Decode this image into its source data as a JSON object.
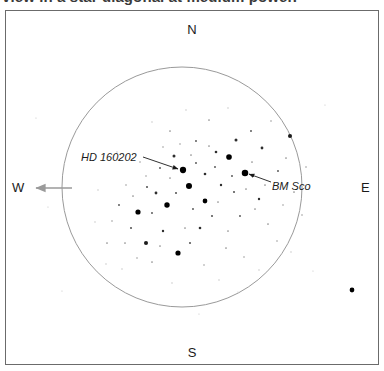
{
  "caption": {
    "text": "view in a star diagonal at medium power."
  },
  "chart_data": {
    "type": "scatter",
    "title": "",
    "subtitle": "",
    "xlabel": "",
    "ylabel": "",
    "grid": false,
    "legend": "none",
    "field_circle": {
      "cx": 182,
      "cy": 187,
      "r": 120,
      "stroke": "#9a9a9a",
      "stroke_width": 1
    },
    "orientation": {
      "north": "N",
      "south": "S",
      "east": "E",
      "west": "W"
    },
    "west_arrow": {
      "x1": 72,
      "y1": 188,
      "x2": 36,
      "y2": 188,
      "color": "#9a9a9a"
    },
    "annotations": [
      {
        "id": "hd160202",
        "label": "HD 160202",
        "label_x": 81,
        "label_y": 151,
        "leader_x1": 143,
        "leader_y1": 157,
        "leader_x2": 178,
        "leader_y2": 169,
        "target_x": 183,
        "target_y": 170
      },
      {
        "id": "bmsco",
        "label": "BM Sco",
        "label_x": 272,
        "label_y": 180,
        "leader_x1": 271,
        "leader_y1": 182,
        "leader_x2": 249,
        "leader_y2": 174,
        "target_x": 245,
        "target_y": 173
      }
    ],
    "stars": [
      {
        "x": 183,
        "y": 170,
        "mag": 2.9,
        "note": "HD 160202"
      },
      {
        "x": 245,
        "y": 173,
        "mag": 3.0,
        "note": "BM Sco"
      },
      {
        "x": 229,
        "y": 157,
        "mag": 2.6
      },
      {
        "x": 189,
        "y": 186,
        "mag": 2.8
      },
      {
        "x": 167,
        "y": 205,
        "mag": 2.5
      },
      {
        "x": 138,
        "y": 212,
        "mag": 2.4
      },
      {
        "x": 205,
        "y": 201,
        "mag": 2.2
      },
      {
        "x": 178,
        "y": 253,
        "mag": 2.4
      },
      {
        "x": 146,
        "y": 243,
        "mag": 1.9
      },
      {
        "x": 290,
        "y": 136,
        "mag": 1.9
      },
      {
        "x": 352,
        "y": 290,
        "mag": 2.2
      },
      {
        "x": 236,
        "y": 140,
        "mag": 1.4
      },
      {
        "x": 262,
        "y": 148,
        "mag": 1.3
      },
      {
        "x": 174,
        "y": 156,
        "mag": 1.4
      },
      {
        "x": 216,
        "y": 152,
        "mag": 1.2
      },
      {
        "x": 156,
        "y": 193,
        "mag": 1.3
      },
      {
        "x": 200,
        "y": 228,
        "mag": 1.2
      },
      {
        "x": 221,
        "y": 185,
        "mag": 1.1
      },
      {
        "x": 259,
        "y": 199,
        "mag": 1.1
      },
      {
        "x": 147,
        "y": 187,
        "mag": 1.0
      },
      {
        "x": 131,
        "y": 228,
        "mag": 1.0
      },
      {
        "x": 163,
        "y": 231,
        "mag": 1.1
      },
      {
        "x": 190,
        "y": 243,
        "mag": 1.0
      },
      {
        "x": 212,
        "y": 216,
        "mag": 1.0
      },
      {
        "x": 240,
        "y": 216,
        "mag": 0.9
      },
      {
        "x": 278,
        "y": 171,
        "mag": 0.9
      },
      {
        "x": 251,
        "y": 131,
        "mag": 0.9
      },
      {
        "x": 196,
        "y": 141,
        "mag": 0.9
      },
      {
        "x": 160,
        "y": 168,
        "mag": 0.9
      },
      {
        "x": 119,
        "y": 205,
        "mag": 0.9
      },
      {
        "x": 107,
        "y": 243,
        "mag": 0.8
      },
      {
        "x": 152,
        "y": 262,
        "mag": 0.8
      },
      {
        "x": 226,
        "y": 248,
        "mag": 0.8
      },
      {
        "x": 268,
        "y": 224,
        "mag": 0.8
      },
      {
        "x": 294,
        "y": 192,
        "mag": 0.8
      },
      {
        "x": 286,
        "y": 158,
        "mag": 0.8
      },
      {
        "x": 209,
        "y": 120,
        "mag": 0.8
      },
      {
        "x": 170,
        "y": 131,
        "mag": 0.8
      },
      {
        "x": 140,
        "y": 162,
        "mag": 0.7
      },
      {
        "x": 126,
        "y": 185,
        "mag": 0.7
      },
      {
        "x": 112,
        "y": 221,
        "mag": 0.7
      },
      {
        "x": 137,
        "y": 258,
        "mag": 0.7
      },
      {
        "x": 204,
        "y": 265,
        "mag": 0.7
      },
      {
        "x": 244,
        "y": 257,
        "mag": 0.7
      },
      {
        "x": 277,
        "y": 241,
        "mag": 0.7
      },
      {
        "x": 302,
        "y": 215,
        "mag": 0.7
      },
      {
        "x": 306,
        "y": 167,
        "mag": 0.7
      },
      {
        "x": 271,
        "y": 121,
        "mag": 0.7
      },
      {
        "x": 228,
        "y": 108,
        "mag": 0.6
      },
      {
        "x": 186,
        "y": 110,
        "mag": 0.6
      },
      {
        "x": 152,
        "y": 122,
        "mag": 0.6
      },
      {
        "x": 117,
        "y": 152,
        "mag": 0.6
      },
      {
        "x": 98,
        "y": 190,
        "mag": 0.6
      },
      {
        "x": 95,
        "y": 222,
        "mag": 0.6
      },
      {
        "x": 122,
        "y": 269,
        "mag": 0.6
      },
      {
        "x": 172,
        "y": 283,
        "mag": 0.6
      },
      {
        "x": 219,
        "y": 280,
        "mag": 0.6
      },
      {
        "x": 259,
        "y": 270,
        "mag": 0.6
      },
      {
        "x": 291,
        "y": 252,
        "mag": 0.6
      },
      {
        "x": 205,
        "y": 174,
        "mag": 1.2
      },
      {
        "x": 215,
        "y": 167,
        "mag": 0.9
      },
      {
        "x": 196,
        "y": 163,
        "mag": 0.9
      },
      {
        "x": 232,
        "y": 176,
        "mag": 0.9
      },
      {
        "x": 234,
        "y": 192,
        "mag": 1.0
      },
      {
        "x": 176,
        "y": 193,
        "mag": 1.0
      },
      {
        "x": 193,
        "y": 209,
        "mag": 0.9
      },
      {
        "x": 152,
        "y": 213,
        "mag": 0.9
      },
      {
        "x": 218,
        "y": 202,
        "mag": 0.8
      },
      {
        "x": 246,
        "y": 189,
        "mag": 0.8
      },
      {
        "x": 170,
        "y": 178,
        "mag": 0.8
      },
      {
        "x": 191,
        "y": 155,
        "mag": 0.8
      },
      {
        "x": 209,
        "y": 146,
        "mag": 0.8
      },
      {
        "x": 252,
        "y": 162,
        "mag": 0.8
      },
      {
        "x": 265,
        "y": 185,
        "mag": 0.8
      },
      {
        "x": 133,
        "y": 196,
        "mag": 0.8
      },
      {
        "x": 125,
        "y": 243,
        "mag": 0.8
      },
      {
        "x": 160,
        "y": 246,
        "mag": 0.8
      },
      {
        "x": 185,
        "y": 228,
        "mag": 0.8
      },
      {
        "x": 228,
        "y": 231,
        "mag": 0.8
      },
      {
        "x": 255,
        "y": 209,
        "mag": 0.8
      },
      {
        "x": 283,
        "y": 205,
        "mag": 0.7
      },
      {
        "x": 180,
        "y": 144,
        "mag": 0.7
      },
      {
        "x": 163,
        "y": 147,
        "mag": 0.7
      },
      {
        "x": 146,
        "y": 176,
        "mag": 0.7
      },
      {
        "x": 106,
        "y": 264,
        "mag": 0.6
      },
      {
        "x": 62,
        "y": 291,
        "mag": 0.5
      },
      {
        "x": 48,
        "y": 207,
        "mag": 0.5
      },
      {
        "x": 36,
        "y": 118,
        "mag": 0.5
      },
      {
        "x": 325,
        "y": 105,
        "mag": 0.5
      },
      {
        "x": 238,
        "y": 292,
        "mag": 0.5
      },
      {
        "x": 199,
        "y": 314,
        "mag": 0.5
      },
      {
        "x": 313,
        "y": 271,
        "mag": 0.5
      }
    ]
  }
}
